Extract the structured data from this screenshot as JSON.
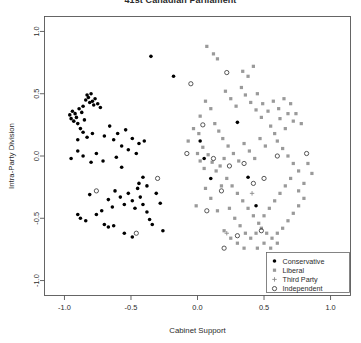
{
  "chart_data": {
    "type": "scatter",
    "title": "41st Canadian Parliament",
    "xlabel": "Cabinet Support",
    "ylabel": "Intra-Party Division",
    "xlim": [
      -1.15,
      1.15
    ],
    "ylim": [
      -1.12,
      1.12
    ],
    "xticks": [
      -1.0,
      -0.5,
      0.0,
      0.5,
      1.0
    ],
    "xtick_labels": [
      "-1.0",
      "-0.5",
      "0.0",
      "0.5",
      "1.0"
    ],
    "yticks": [
      -1.0,
      -0.5,
      0.0,
      0.5,
      1.0
    ],
    "ytick_labels": [
      "-1.0",
      "-0.5",
      "0.0",
      "0.5",
      "1.0"
    ],
    "grid": false,
    "legend_position": "bottom-right",
    "series": [
      {
        "name": "Conservative",
        "marker": "filled-circle",
        "color": "#000000",
        "points": [
          [
            -0.96,
            0.33
          ],
          [
            -0.95,
            0.3
          ],
          [
            -0.94,
            0.36
          ],
          [
            -0.93,
            0.28
          ],
          [
            -0.92,
            0.34
          ],
          [
            -0.91,
            0.31
          ],
          [
            -0.9,
            0.26
          ],
          [
            -0.89,
            0.38
          ],
          [
            -0.88,
            0.22
          ],
          [
            -0.87,
            0.35
          ],
          [
            -0.86,
            0.4
          ],
          [
            -0.85,
            0.29
          ],
          [
            -0.84,
            0.45
          ],
          [
            -0.83,
            0.49
          ],
          [
            -0.82,
            0.47
          ],
          [
            -0.81,
            0.43
          ],
          [
            -0.8,
            0.5
          ],
          [
            -0.79,
            0.44
          ],
          [
            -0.78,
            0.41
          ],
          [
            -0.77,
            0.46
          ],
          [
            -0.86,
            0.19
          ],
          [
            -0.9,
            0.13
          ],
          [
            -0.83,
            0.15
          ],
          [
            -0.79,
            0.18
          ],
          [
            -0.75,
            0.42
          ],
          [
            -0.73,
            0.39
          ],
          [
            -0.7,
            0.16
          ],
          [
            -0.66,
            0.24
          ],
          [
            -0.63,
            0.13
          ],
          [
            -0.6,
            0.18
          ],
          [
            -0.57,
            0.08
          ],
          [
            -0.54,
            0.21
          ],
          [
            -0.52,
            0.05
          ],
          [
            -0.49,
            0.14
          ],
          [
            -0.46,
            0.02
          ],
          [
            -0.44,
            0.1
          ],
          [
            -0.95,
            -0.02
          ],
          [
            -0.9,
            0.04
          ],
          [
            -0.86,
            0.0
          ],
          [
            -0.8,
            -0.05
          ],
          [
            -0.76,
            0.02
          ],
          [
            -0.71,
            -0.04
          ],
          [
            -0.57,
            -0.09
          ],
          [
            -0.61,
            -0.01
          ],
          [
            -0.4,
            0.12
          ],
          [
            -0.81,
            -0.31
          ],
          [
            -0.76,
            -0.47
          ],
          [
            -0.72,
            -0.44
          ],
          [
            -0.88,
            -0.5
          ],
          [
            -0.84,
            -0.52
          ],
          [
            -0.9,
            -0.47
          ],
          [
            -0.67,
            -0.35
          ],
          [
            -0.64,
            -0.41
          ],
          [
            -0.62,
            -0.28
          ],
          [
            -0.58,
            -0.33
          ],
          [
            -0.55,
            -0.39
          ],
          [
            -0.7,
            -0.55
          ],
          [
            -0.67,
            -0.57
          ],
          [
            -0.63,
            -0.56
          ],
          [
            -0.52,
            -0.3
          ],
          [
            -0.49,
            -0.36
          ],
          [
            -0.47,
            -0.42
          ],
          [
            -0.45,
            -0.26
          ],
          [
            -0.43,
            -0.33
          ],
          [
            -0.41,
            -0.39
          ],
          [
            -0.38,
            -0.45
          ],
          [
            -0.36,
            -0.51
          ],
          [
            -0.34,
            -0.55
          ],
          [
            -0.44,
            -0.22
          ],
          [
            -0.41,
            -0.17
          ],
          [
            -0.38,
            -0.24
          ],
          [
            -0.31,
            -0.3
          ],
          [
            -0.28,
            -0.38
          ],
          [
            -0.26,
            -0.6
          ],
          [
            -0.55,
            -0.62
          ],
          [
            -0.49,
            -0.65
          ],
          [
            -0.35,
            0.8
          ],
          [
            -0.18,
            0.64
          ],
          [
            0.02,
            0.12
          ],
          [
            0.1,
            -0.18
          ],
          [
            0.38,
            -0.17
          ],
          [
            0.3,
            0.27
          ],
          [
            0.05,
            -0.02
          ],
          [
            0.44,
            -0.4
          ]
        ]
      },
      {
        "name": "Liberal",
        "marker": "filled-square",
        "color": "#9a9a9a",
        "points": [
          [
            0.07,
            0.88
          ],
          [
            0.12,
            0.82
          ],
          [
            0.15,
            0.78
          ],
          [
            0.34,
            0.68
          ],
          [
            0.38,
            0.64
          ],
          [
            0.42,
            0.72
          ],
          [
            0.21,
            0.52
          ],
          [
            0.25,
            0.46
          ],
          [
            0.29,
            0.4
          ],
          [
            0.33,
            0.55
          ],
          [
            0.36,
            0.49
          ],
          [
            0.4,
            0.43
          ],
          [
            0.44,
            0.37
          ],
          [
            0.48,
            0.31
          ],
          [
            0.1,
            0.38
          ],
          [
            0.06,
            0.44
          ],
          [
            0.02,
            0.32
          ],
          [
            0.13,
            0.26
          ],
          [
            0.16,
            0.2
          ],
          [
            0.19,
            0.14
          ],
          [
            0.01,
            0.18
          ],
          [
            -0.03,
            0.22
          ],
          [
            -0.07,
            0.12
          ],
          [
            0.04,
            0.07
          ],
          [
            0.08,
            0.01
          ],
          [
            0.11,
            -0.05
          ],
          [
            0.05,
            -0.1
          ],
          [
            0.02,
            -0.04
          ],
          [
            0.0,
            0.02
          ],
          [
            0.14,
            -0.12
          ],
          [
            0.17,
            -0.08
          ],
          [
            0.2,
            -0.02
          ],
          [
            0.23,
            0.08
          ],
          [
            0.27,
            0.02
          ],
          [
            0.31,
            -0.04
          ],
          [
            0.35,
            0.1
          ],
          [
            0.39,
            0.04
          ],
          [
            0.43,
            -0.02
          ],
          [
            0.47,
            0.14
          ],
          [
            0.51,
            0.08
          ],
          [
            0.55,
            0.24
          ],
          [
            0.58,
            0.18
          ],
          [
            0.62,
            0.3
          ],
          [
            0.53,
            0.36
          ],
          [
            0.49,
            0.42
          ],
          [
            0.45,
            0.5
          ],
          [
            0.57,
            0.44
          ],
          [
            0.61,
            0.38
          ],
          [
            0.65,
            0.46
          ],
          [
            0.68,
            0.34
          ],
          [
            0.72,
            0.28
          ],
          [
            0.66,
            0.22
          ],
          [
            0.6,
            0.12
          ],
          [
            0.64,
            0.06
          ],
          [
            0.68,
            0.0
          ],
          [
            0.72,
            -0.06
          ],
          [
            0.76,
            -0.12
          ],
          [
            0.7,
            -0.18
          ],
          [
            0.66,
            -0.24
          ],
          [
            0.62,
            -0.3
          ],
          [
            0.58,
            -0.36
          ],
          [
            0.54,
            -0.42
          ],
          [
            0.5,
            -0.48
          ],
          [
            0.46,
            -0.54
          ],
          [
            0.42,
            -0.48
          ],
          [
            0.38,
            -0.42
          ],
          [
            0.34,
            -0.36
          ],
          [
            0.3,
            -0.3
          ],
          [
            0.26,
            -0.24
          ],
          [
            0.22,
            -0.18
          ],
          [
            0.18,
            -0.24
          ],
          [
            0.24,
            -0.42
          ],
          [
            0.28,
            -0.5
          ],
          [
            0.32,
            -0.56
          ],
          [
            0.36,
            -0.62
          ],
          [
            0.4,
            -0.66
          ],
          [
            0.44,
            -0.62
          ],
          [
            0.48,
            -0.58
          ],
          [
            0.52,
            -0.62
          ],
          [
            0.56,
            -0.66
          ],
          [
            0.6,
            -0.62
          ],
          [
            0.64,
            -0.58
          ],
          [
            0.68,
            -0.52
          ],
          [
            0.72,
            -0.46
          ],
          [
            0.76,
            -0.4
          ],
          [
            0.8,
            -0.34
          ],
          [
            0.76,
            -0.28
          ],
          [
            0.8,
            -0.22
          ],
          [
            0.74,
            0.34
          ],
          [
            0.78,
            0.26
          ],
          [
            0.7,
            0.42
          ],
          [
            0.83,
            -0.06
          ],
          [
            0.86,
            -0.14
          ],
          [
            0.06,
            -0.26
          ],
          [
            0.1,
            -0.34
          ],
          [
            -0.01,
            -0.4
          ],
          [
            0.15,
            -0.44
          ],
          [
            0.2,
            -0.6
          ],
          [
            0.25,
            -0.66
          ],
          [
            0.3,
            -0.7
          ],
          [
            0.35,
            -0.74
          ],
          [
            0.5,
            -0.7
          ],
          [
            0.55,
            -0.74
          ],
          [
            0.6,
            -0.7
          ],
          [
            0.45,
            -0.74
          ]
        ]
      },
      {
        "name": "Third Party",
        "marker": "plus",
        "color": "#8a8a8a",
        "points": [
          [
            0.22,
            -0.62
          ],
          [
            0.41,
            -0.3
          ]
        ]
      },
      {
        "name": "Independent",
        "marker": "open-circle",
        "color": "#3a3a3a",
        "points": [
          [
            0.22,
            0.67
          ],
          [
            -0.05,
            0.58
          ],
          [
            0.04,
            0.25
          ],
          [
            -0.08,
            0.02
          ],
          [
            0.12,
            -0.02
          ],
          [
            0.6,
            0.0
          ],
          [
            0.82,
            0.02
          ],
          [
            0.35,
            -0.06
          ],
          [
            0.24,
            -0.08
          ],
          [
            0.18,
            -0.28
          ],
          [
            0.42,
            -0.22
          ],
          [
            0.5,
            -0.18
          ],
          [
            0.48,
            -0.6
          ],
          [
            0.07,
            -0.44
          ],
          [
            -0.3,
            -0.18
          ],
          [
            -0.76,
            -0.28
          ],
          [
            -0.46,
            -0.62
          ],
          [
            0.3,
            -0.64
          ],
          [
            0.2,
            -0.74
          ]
        ]
      }
    ]
  },
  "legend": {
    "items": [
      {
        "label": "Conservative",
        "marker": "filled-circle"
      },
      {
        "label": "Liberal",
        "marker": "filled-square"
      },
      {
        "label": "Third Party",
        "marker": "plus"
      },
      {
        "label": "Independent",
        "marker": "open-circle"
      }
    ]
  }
}
